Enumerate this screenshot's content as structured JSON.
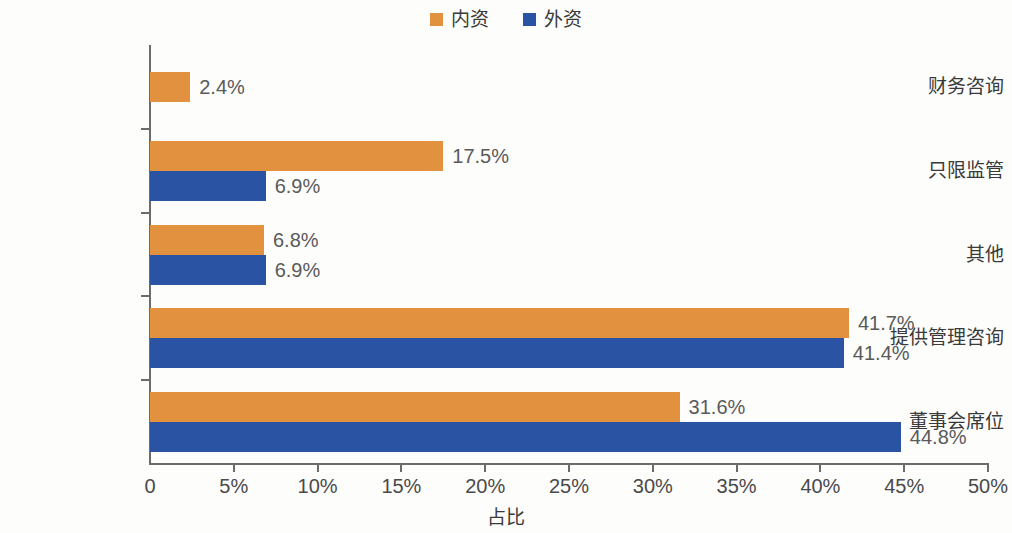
{
  "chart_data": {
    "type": "bar",
    "orientation": "horizontal",
    "grouped": true,
    "title": "",
    "xlabel": "占比",
    "ylabel": "",
    "xlim": [
      0,
      50
    ],
    "xunit": "%",
    "grid": false,
    "legend_position": "top-center",
    "categories": [
      "财务咨询",
      "只限监管",
      "其他",
      "提供管理咨询",
      "董事会席位"
    ],
    "series": [
      {
        "name": "内资",
        "color": "#e2923f",
        "values": [
          2.4,
          17.5,
          6.8,
          41.7,
          31.6
        ],
        "labels": [
          "2.4%",
          "17.5%",
          "6.8%",
          "41.7%",
          "31.6%"
        ]
      },
      {
        "name": "外资",
        "color": "#2b53a3",
        "values": [
          null,
          6.9,
          6.9,
          41.4,
          44.8
        ],
        "labels": [
          "",
          "6.9%",
          "6.9%",
          "41.4%",
          "44.8%"
        ]
      }
    ],
    "xticks": [
      {
        "value": 0,
        "label": "0"
      },
      {
        "value": 5,
        "label": "5%"
      },
      {
        "value": 10,
        "label": "10%"
      },
      {
        "value": 15,
        "label": "15%"
      },
      {
        "value": 20,
        "label": "20%"
      },
      {
        "value": 25,
        "label": "25%"
      },
      {
        "value": 30,
        "label": "30%"
      },
      {
        "value": 35,
        "label": "35%"
      },
      {
        "value": 40,
        "label": "40%"
      },
      {
        "value": 45,
        "label": "45%"
      },
      {
        "value": 50,
        "label": "50%"
      }
    ]
  },
  "legend": {
    "items": [
      {
        "label": "内资",
        "color": "#e2923f"
      },
      {
        "label": "外资",
        "color": "#2b53a3"
      }
    ]
  },
  "axis": {
    "x_title": "占比"
  }
}
